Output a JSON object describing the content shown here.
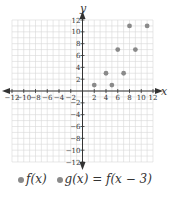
{
  "chart_data": {
    "type": "scatter",
    "title": "",
    "xlabel": "x",
    "ylabel": "y",
    "xlim": [
      -12,
      12
    ],
    "ylim": [
      -12,
      12
    ],
    "grid": true,
    "x_ticks": [
      -12,
      -10,
      -8,
      -6,
      -4,
      -2,
      2,
      4,
      6,
      8,
      10,
      12
    ],
    "y_ticks": [
      -12,
      -10,
      -8,
      -6,
      -4,
      -2,
      2,
      4,
      6,
      8,
      10,
      12
    ],
    "legend_position": "bottom",
    "series": [
      {
        "name": "f(x)",
        "color": "#8a8a8a",
        "points": [
          [
            2,
            1
          ],
          [
            4,
            3
          ],
          [
            6,
            7
          ],
          [
            8,
            11
          ]
        ]
      },
      {
        "name": "g(x) = f(x − 3)",
        "color": "#8a8a8a",
        "points": [
          [
            5,
            1
          ],
          [
            7,
            3
          ],
          [
            9,
            7
          ],
          [
            11,
            11
          ]
        ]
      }
    ]
  },
  "legend": {
    "items": [
      {
        "label": "f(x)",
        "color": "#8a8a8a"
      },
      {
        "label": "g(x) = f(x − 3)",
        "color": "#8a8a8a"
      }
    ]
  },
  "colors": {
    "grid": "#d9d9d9",
    "axis": "#333333",
    "text": "#333333"
  }
}
